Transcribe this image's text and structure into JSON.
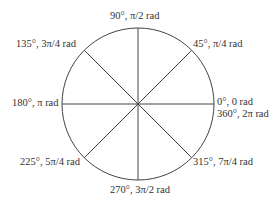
{
  "diagram": {
    "type": "unit-circle-angles",
    "center": [
      138,
      104
    ],
    "radius": 76,
    "stroke_color": "#444444",
    "radii_angles_deg": [
      0,
      45,
      90,
      135,
      180,
      225,
      270,
      315
    ],
    "labels": [
      {
        "id": "deg0",
        "text": "0°, 0 rad"
      },
      {
        "id": "deg360",
        "text": "360°, 2π rad"
      },
      {
        "id": "deg45",
        "text": "45°, π/4 rad"
      },
      {
        "id": "deg90",
        "text": "90°, π/2 rad"
      },
      {
        "id": "deg135",
        "text": "135°, 3π/4 rad"
      },
      {
        "id": "deg180",
        "text": "180°, π rad"
      },
      {
        "id": "deg225",
        "text": "225°, 5π/4 rad"
      },
      {
        "id": "deg270",
        "text": "270°, 3π/2 rad"
      },
      {
        "id": "deg315",
        "text": "315°, 7π/4 rad"
      }
    ]
  }
}
